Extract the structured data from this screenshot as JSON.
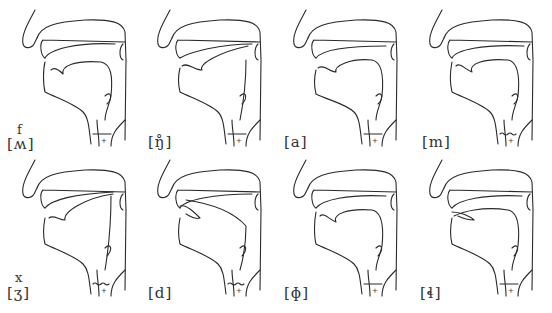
{
  "diagram": {
    "type": "sagittal-vocal-tract-grid",
    "rows": 2,
    "columns": 4,
    "panels": [
      {
        "label": "[ʍ]",
        "annotation": "f",
        "larynx": "open"
      },
      {
        "label": "[ŋ̊]",
        "annotation": "",
        "larynx": "open"
      },
      {
        "label": "[a]",
        "annotation": "",
        "larynx": "open"
      },
      {
        "label": "[m]",
        "annotation": "",
        "larynx": "voiced"
      },
      {
        "label": "[ʒ]",
        "annotation": "x",
        "larynx": "voiced"
      },
      {
        "label": "[d]",
        "annotation": "",
        "larynx": "voiced"
      },
      {
        "label": "[ɸ]",
        "annotation": "",
        "larynx": "open"
      },
      {
        "label": "[ɬ]",
        "annotation": "",
        "larynx": "open"
      }
    ]
  }
}
